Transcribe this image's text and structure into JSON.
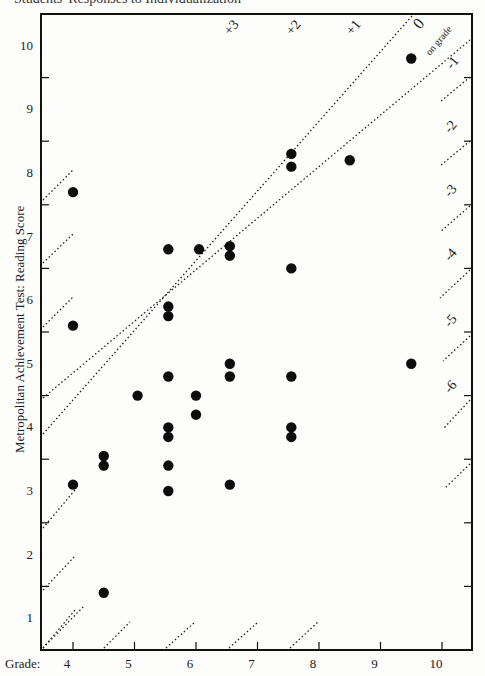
{
  "heading": "Students' Responses to Individualization",
  "chart_data": {
    "type": "scatter",
    "title": "",
    "xlabel": "Grade:",
    "ylabel": "Metropolitan Achievement Test:  Reading Score",
    "xlim": [
      3.5,
      10.5
    ],
    "ylim": [
      0.5,
      10.5
    ],
    "x_ticks": [
      4,
      5,
      6,
      7,
      8,
      9,
      10
    ],
    "y_ticks": [
      1,
      2,
      3,
      4,
      5,
      6,
      7,
      8,
      9,
      10
    ],
    "grid": false,
    "diagonal_labels": [
      "+3",
      "+2",
      "+1",
      "0",
      "on grade",
      "-1",
      "-2",
      "-3",
      "-4",
      "-5",
      "-6"
    ],
    "annotation": "Dotted diagonal lines mark grade-level offsets (+3 to -6 years relative to on-grade)",
    "points": [
      {
        "x": 4.0,
        "y": 7.7
      },
      {
        "x": 4.0,
        "y": 5.6
      },
      {
        "x": 4.0,
        "y": 3.1
      },
      {
        "x": 4.5,
        "y": 3.4
      },
      {
        "x": 4.5,
        "y": 3.55
      },
      {
        "x": 4.5,
        "y": 1.4
      },
      {
        "x": 5.05,
        "y": 4.5
      },
      {
        "x": 5.55,
        "y": 6.8
      },
      {
        "x": 5.55,
        "y": 5.9
      },
      {
        "x": 5.55,
        "y": 5.75
      },
      {
        "x": 5.55,
        "y": 4.8
      },
      {
        "x": 5.55,
        "y": 4.0
      },
      {
        "x": 5.55,
        "y": 3.85
      },
      {
        "x": 5.55,
        "y": 3.4
      },
      {
        "x": 5.55,
        "y": 3.0
      },
      {
        "x": 6.0,
        "y": 4.5
      },
      {
        "x": 6.0,
        "y": 4.2
      },
      {
        "x": 6.05,
        "y": 6.8
      },
      {
        "x": 6.55,
        "y": 6.85
      },
      {
        "x": 6.55,
        "y": 6.7
      },
      {
        "x": 6.55,
        "y": 5.0
      },
      {
        "x": 6.55,
        "y": 4.8
      },
      {
        "x": 6.55,
        "y": 3.1
      },
      {
        "x": 7.55,
        "y": 8.3
      },
      {
        "x": 7.55,
        "y": 8.1
      },
      {
        "x": 7.55,
        "y": 6.5
      },
      {
        "x": 7.55,
        "y": 4.8
      },
      {
        "x": 7.55,
        "y": 4.0
      },
      {
        "x": 7.55,
        "y": 3.85
      },
      {
        "x": 8.5,
        "y": 8.2
      },
      {
        "x": 9.5,
        "y": 9.8
      },
      {
        "x": 9.5,
        "y": 5.0
      }
    ]
  }
}
